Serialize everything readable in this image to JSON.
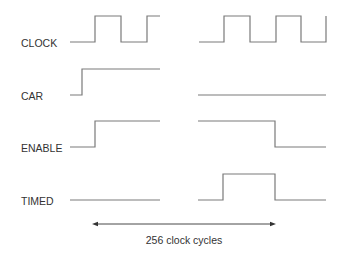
{
  "diagram": {
    "type": "timing-diagram",
    "colors": {
      "line": "#7a7a7a",
      "text": "#333333",
      "arrow": "#333333",
      "background": "#ffffff"
    },
    "signals": [
      {
        "name": "CLOCK",
        "label_pos": [
          21,
          37
        ],
        "segments": [
          {
            "points": [
              [
                70,
                42
              ],
              [
                95,
                42
              ],
              [
                95,
                16
              ],
              [
                121,
                16
              ],
              [
                121,
                42
              ],
              [
                147,
                42
              ],
              [
                147,
                16
              ],
              [
                160,
                16
              ]
            ]
          },
          {
            "points": [
              [
                199,
                42
              ],
              [
                224,
                42
              ],
              [
                224,
                16
              ],
              [
                250,
                16
              ],
              [
                250,
                42
              ],
              [
                276,
                42
              ],
              [
                276,
                16
              ],
              [
                301,
                16
              ],
              [
                301,
                42
              ],
              [
                326,
                42
              ],
              [
                326,
                16
              ]
            ]
          }
        ]
      },
      {
        "name": "CAR",
        "label_pos": [
          21,
          90
        ],
        "segments": [
          {
            "points": [
              [
                70,
                95
              ],
              [
                82,
                95
              ],
              [
                82,
                69
              ],
              [
                160,
                69
              ]
            ]
          },
          {
            "points": [
              [
                198,
                95
              ],
              [
                326,
                95
              ]
            ]
          }
        ]
      },
      {
        "name": "ENABLE",
        "label_pos": [
          21,
          142
        ],
        "segments": [
          {
            "points": [
              [
                70,
                147
              ],
              [
                95,
                147
              ],
              [
                95,
                121
              ],
              [
                160,
                121
              ]
            ]
          },
          {
            "points": [
              [
                198,
                121
              ],
              [
                275,
                121
              ],
              [
                275,
                147
              ],
              [
                326,
                147
              ]
            ]
          }
        ]
      },
      {
        "name": "TIMED",
        "label_pos": [
          21,
          195
        ],
        "segments": [
          {
            "points": [
              [
                70,
                200
              ],
              [
                160,
                200
              ]
            ]
          },
          {
            "points": [
              [
                198,
                200
              ],
              [
                223,
                200
              ],
              [
                223,
                174
              ],
              [
                275,
                174
              ],
              [
                275,
                200
              ],
              [
                326,
                200
              ]
            ]
          }
        ]
      }
    ],
    "span_arrow": {
      "x1": 92,
      "x2": 276,
      "y": 224,
      "label": "256 clock cycles",
      "label_pos": [
        184,
        234
      ]
    }
  }
}
